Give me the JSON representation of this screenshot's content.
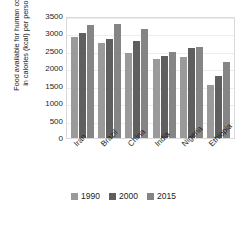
{
  "chart_data": {
    "type": "bar",
    "title": "",
    "subtitle": "",
    "xlabel": "",
    "ylabel": "Food available for human consumption in calories (kcal) per person per day",
    "categories": [
      "Iran",
      "Brazil",
      "China",
      "India",
      "Nigeria",
      "Ethiopia"
    ],
    "series": [
      {
        "name": "1990",
        "color": "#9a9a9a",
        "values": [
          2900,
          2720,
          2450,
          2270,
          2320,
          1520
        ]
      },
      {
        "name": "2000",
        "color": "#5f5f5f",
        "values": [
          3000,
          2850,
          2780,
          2360,
          2590,
          1790
        ]
      },
      {
        "name": "2015",
        "color": "#858585",
        "values": [
          3250,
          3270,
          3120,
          2460,
          2620,
          2190
        ]
      }
    ],
    "ylim": [
      0,
      3500
    ],
    "ytick_values": [
      0,
      500,
      1000,
      1500,
      2000,
      2500,
      3000,
      3500
    ],
    "ytick_labels": [
      "0",
      "500",
      "1000",
      "1500",
      "2000",
      "2500",
      "3000",
      "3500"
    ],
    "grid": true,
    "grid_axis": "y",
    "legend_position": "bottom",
    "legend_entries": [
      "1990",
      "2000",
      "2015"
    ]
  }
}
